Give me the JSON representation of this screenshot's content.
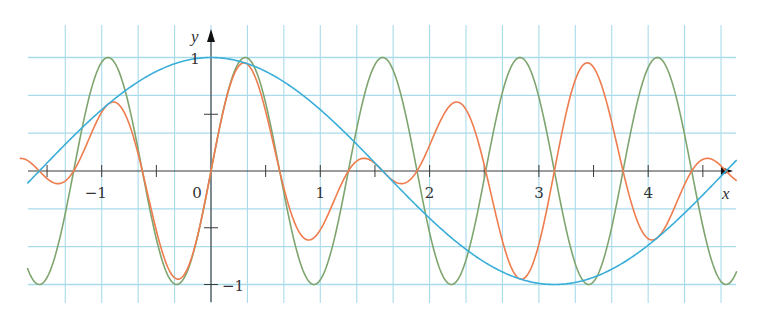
{
  "chart_data": {
    "type": "line",
    "title": "",
    "xlabel": "x",
    "ylabel": "y",
    "xlim": [
      -1.68,
      4.82
    ],
    "ylim": [
      -1.15,
      1.15
    ],
    "grid": true,
    "grid_step": {
      "x": 0.3333,
      "y": 0.3333
    },
    "legend": null,
    "x_ticks": [
      -1.5,
      -1,
      -0.5,
      0,
      0.5,
      1,
      1.5,
      2,
      2.5,
      3,
      3.5,
      4,
      4.5
    ],
    "x_tick_labels": [
      {
        "value": -1,
        "label": "−1"
      },
      {
        "value": 0,
        "label": "0"
      },
      {
        "value": 1,
        "label": "1"
      },
      {
        "value": 2,
        "label": "2"
      },
      {
        "value": 3,
        "label": "3"
      },
      {
        "value": 4,
        "label": "4"
      }
    ],
    "y_ticks": [
      -1,
      -0.5,
      0.5,
      1
    ],
    "y_tick_labels": [
      {
        "value": 1,
        "label": "1"
      },
      {
        "value": -1,
        "label": "−1"
      }
    ],
    "series": [
      {
        "name": "cos(x)",
        "expression": "cos(x)",
        "color": "#3aaed8",
        "domain": [
          -1.68,
          4.81
        ],
        "sample_points": {
          "x": [
            -1.5708,
            0,
            1.5708,
            3.1416,
            4.7124
          ],
          "y": [
            0,
            1,
            0,
            -1,
            0
          ]
        }
      },
      {
        "name": "sin(5x)",
        "expression": "sin(5x)",
        "color": "#7fa56f",
        "domain": [
          -1.68,
          4.81
        ],
        "sample_points": {
          "x": [
            -0.9425,
            -0.3142,
            0,
            0.3142,
            0.9425,
            1.5708,
            2.1991,
            2.8274,
            3.4558,
            4.0841,
            4.7124
          ],
          "y": [
            1,
            -1,
            0,
            1,
            -1,
            1,
            -1,
            1,
            -1,
            1,
            -1
          ]
        }
      },
      {
        "name": "cos(x)·sin(5x)",
        "expression": "cos(x)*sin(5x)",
        "color": "#ee7c4e",
        "domain": [
          -1.75,
          4.81
        ],
        "sample_points": {
          "x": [
            -0.94,
            -0.31,
            0.31,
            0.94,
            2.2,
            2.83,
            3.46,
            4.08
          ],
          "y": [
            0.59,
            -0.95,
            0.95,
            -0.59,
            -0.59,
            0.95,
            -0.95,
            0.59
          ]
        }
      }
    ]
  },
  "axes": {
    "x_label": "x",
    "y_label": "y"
  },
  "colors": {
    "grid": "#a9dbea",
    "axis": "#3a3a3a",
    "background": "#ffffff"
  }
}
